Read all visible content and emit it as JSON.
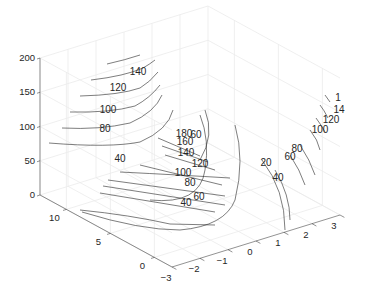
{
  "chart_data": {
    "type": "contour3",
    "title": "",
    "xlabel": "",
    "ylabel": "",
    "zlabel": "",
    "x_ticks": [
      -3,
      -2,
      -1,
      0,
      1,
      2,
      3
    ],
    "y_ticks": [
      0,
      5,
      10
    ],
    "z_ticks": [
      0,
      50,
      100,
      150,
      200
    ],
    "xlim": [
      -3,
      3
    ],
    "ylim": [
      -2,
      13
    ],
    "zlim": [
      0,
      200
    ],
    "grid": true,
    "view": "default-3d",
    "contour_levels": [
      20,
      40,
      60,
      80,
      100,
      120,
      140,
      160,
      180
    ],
    "contour_labels": [
      {
        "text": "140",
        "group": "left"
      },
      {
        "text": "120",
        "group": "left"
      },
      {
        "text": "100",
        "group": "left"
      },
      {
        "text": "80",
        "group": "left"
      },
      {
        "text": "40",
        "group": "left"
      },
      {
        "text": "180",
        "group": "middle"
      },
      {
        "text": "60",
        "group": "middle"
      },
      {
        "text": "160",
        "group": "middle"
      },
      {
        "text": "140",
        "group": "middle"
      },
      {
        "text": "120",
        "group": "middle"
      },
      {
        "text": "100",
        "group": "middle"
      },
      {
        "text": "80",
        "group": "middle"
      },
      {
        "text": "60",
        "group": "middle"
      },
      {
        "text": "40",
        "group": "middle"
      },
      {
        "text": "20",
        "group": "right"
      },
      {
        "text": "40",
        "group": "right"
      },
      {
        "text": "60",
        "group": "right"
      },
      {
        "text": "80",
        "group": "right"
      },
      {
        "text": "100",
        "group": "right"
      },
      {
        "text": "120",
        "group": "right"
      },
      {
        "text": "14",
        "group": "right"
      },
      {
        "text": "1",
        "group": "right"
      }
    ]
  }
}
